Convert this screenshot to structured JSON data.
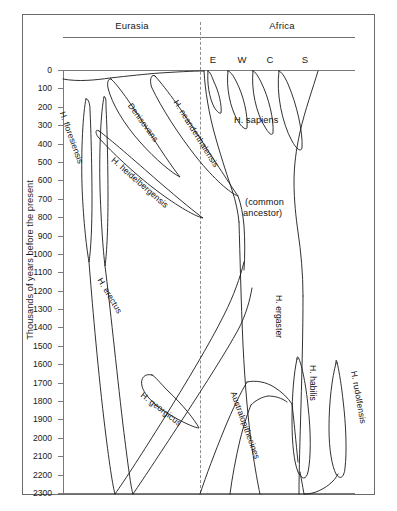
{
  "figure": {
    "title": "",
    "axis_title": "Thousands of years before the present",
    "regions": [
      {
        "name": "eurasia",
        "label": "Eurasia"
      },
      {
        "name": "africa",
        "label": "Africa"
      }
    ],
    "subregions": [
      {
        "name": "east",
        "label": "E"
      },
      {
        "name": "west",
        "label": "W"
      },
      {
        "name": "central",
        "label": "C"
      },
      {
        "name": "south",
        "label": "S"
      }
    ]
  },
  "chart_data": {
    "type": "diagram",
    "ylabel": "Thousands of years before the present",
    "ylim": [
      0,
      2300
    ],
    "y_tick_step": 100,
    "y_axis_inverted": true,
    "grid": false,
    "legend": "none",
    "yticks": [
      "0",
      "100",
      "200",
      "300",
      "400",
      "500",
      "600",
      "700",
      "800",
      "900",
      "1000",
      "1100",
      "1200",
      "1300",
      "1400",
      "1500",
      "1600",
      "1700",
      "1800",
      "1900",
      "2000",
      "2100",
      "2200",
      "2300"
    ],
    "column_groups": [
      {
        "label": "Eurasia",
        "subcolumns": []
      },
      {
        "label": "Africa",
        "subcolumns": [
          "E",
          "W",
          "C",
          "S"
        ]
      }
    ],
    "taxa": [
      {
        "name": "H. floresiensis",
        "region": "Eurasia",
        "range_ka": [
          95,
          700
        ]
      },
      {
        "name": "Denisovans",
        "region": "Eurasia",
        "range_ka": [
          40,
          600
        ]
      },
      {
        "name": "H. neanderthalensis",
        "region": "Eurasia",
        "range_ka": [
          30,
          660
        ]
      },
      {
        "name": "H. heidelbergensis",
        "region": "Eurasia",
        "range_ka": [
          300,
          700
        ]
      },
      {
        "name": "H. sapiens",
        "region": "Africa",
        "range_ka": [
          0,
          200
        ]
      },
      {
        "name": "(common ancestor)",
        "region": "Africa",
        "range_ka": [
          700,
          800
        ]
      },
      {
        "name": "H. erectus",
        "region": "Eurasia",
        "range_ka": [
          100,
          2000
        ]
      },
      {
        "name": "H. georgicus",
        "region": "Eurasia",
        "range_ka": [
          1700,
          2050
        ]
      },
      {
        "name": "H. ergaster",
        "region": "Africa",
        "range_ka": [
          0,
          2200
        ]
      },
      {
        "name": "Australopithecines",
        "region": "Africa",
        "range_ka": [
          1900,
          2300
        ]
      },
      {
        "name": "H. habilis",
        "region": "Africa",
        "range_ka": [
          1650,
          2200
        ]
      },
      {
        "name": "H. rudolfensis",
        "region": "Africa",
        "range_ka": [
          1650,
          2250
        ]
      }
    ]
  },
  "labels": {
    "floresiensis": "H. floresiensis",
    "denisovans": "Denisovans",
    "neanderthalensis": "H. neanderthalensis",
    "heidelbergensis": "H. heidelbergensis",
    "sapiens": "H. sapiens",
    "common_ancestor_line1": "(common",
    "common_ancestor_line2": "ancestor)",
    "erectus": "H. erectus",
    "georgicus": "H. georgicus",
    "ergaster": "H. ergaster",
    "australopithecines": "Australopithecines",
    "habilis": "H. habilis",
    "rudolfensis": "H. rudolfensis"
  },
  "colors": {
    "background": "#ffffff",
    "frame": "#6b6b6b",
    "axis": "#7a7a7a",
    "stroke": "#1a1a1a",
    "text": "#111111",
    "divider": "#8d8d8d"
  }
}
